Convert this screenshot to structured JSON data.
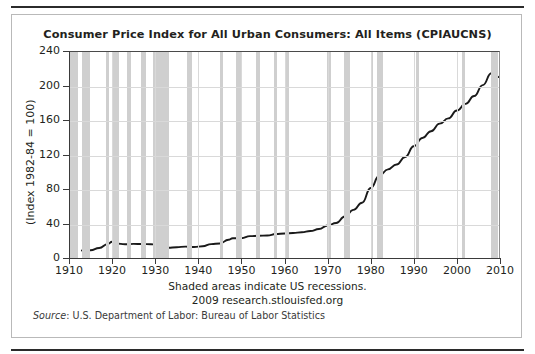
{
  "chart_data": {
    "type": "line",
    "title": "Consumer Price Index for All Urban Consumers: All Items (CPIAUCNS)",
    "xlabel": "",
    "ylabel": "(Index 1982-84 = 100)",
    "xlim": [
      1910,
      2010
    ],
    "ylim": [
      0,
      240
    ],
    "xticks": [
      1910,
      1920,
      1930,
      1940,
      1950,
      1960,
      1970,
      1980,
      1990,
      2000,
      2010
    ],
    "yticks": [
      0,
      40,
      80,
      120,
      160,
      200,
      240
    ],
    "grid": true,
    "legend": null,
    "line_color": "#1a1a1a",
    "band_color": "#cfcfcf",
    "series": [
      {
        "name": "CPIAUCNS",
        "x": [
          1913,
          1915,
          1917,
          1919,
          1920,
          1921,
          1923,
          1925,
          1927,
          1929,
          1930,
          1932,
          1933,
          1935,
          1937,
          1939,
          1941,
          1943,
          1945,
          1947,
          1948,
          1950,
          1952,
          1954,
          1956,
          1958,
          1960,
          1962,
          1964,
          1966,
          1968,
          1970,
          1972,
          1974,
          1976,
          1978,
          1980,
          1982,
          1984,
          1986,
          1988,
          1990,
          1992,
          1994,
          1996,
          1998,
          2000,
          2002,
          2004,
          2006,
          2008,
          2009
        ],
        "values": [
          9.9,
          10.1,
          12.8,
          17.3,
          20.0,
          17.9,
          17.1,
          17.5,
          17.4,
          17.1,
          16.7,
          13.7,
          13.0,
          13.7,
          14.4,
          13.9,
          14.7,
          17.3,
          18.0,
          22.3,
          24.1,
          24.1,
          26.5,
          26.9,
          27.2,
          28.9,
          29.6,
          30.2,
          31.0,
          32.4,
          34.8,
          38.8,
          41.8,
          49.3,
          56.9,
          65.2,
          82.4,
          96.5,
          103.9,
          109.6,
          118.3,
          130.7,
          140.3,
          148.2,
          156.9,
          163.0,
          172.2,
          179.9,
          188.9,
          201.6,
          215.3,
          214.5
        ],
        "last_value": 211.0
      }
    ],
    "recessions": [
      {
        "start": 1910.0,
        "end": 1912.1
      },
      {
        "start": 1913.1,
        "end": 1914.9
      },
      {
        "start": 1918.7,
        "end": 1919.2
      },
      {
        "start": 1920.1,
        "end": 1921.5
      },
      {
        "start": 1923.4,
        "end": 1924.5
      },
      {
        "start": 1926.7,
        "end": 1927.9
      },
      {
        "start": 1929.6,
        "end": 1933.2
      },
      {
        "start": 1937.4,
        "end": 1938.5
      },
      {
        "start": 1945.1,
        "end": 1945.7
      },
      {
        "start": 1948.8,
        "end": 1949.8
      },
      {
        "start": 1953.5,
        "end": 1954.4
      },
      {
        "start": 1957.6,
        "end": 1958.3
      },
      {
        "start": 1960.3,
        "end": 1961.1
      },
      {
        "start": 1969.9,
        "end": 1970.8
      },
      {
        "start": 1973.9,
        "end": 1975.2
      },
      {
        "start": 1980.0,
        "end": 1980.5
      },
      {
        "start": 1981.5,
        "end": 1982.8
      },
      {
        "start": 1990.5,
        "end": 1991.2
      },
      {
        "start": 2001.2,
        "end": 2001.8
      },
      {
        "start": 2007.9,
        "end": 2009.5
      }
    ],
    "notes": [
      "Shaded areas indicate US recessions.",
      "2009 research.stlouisfed.org"
    ],
    "source_label": "Source",
    "source_text": ": U.S. Department of Labor: Bureau of Labor Statistics"
  }
}
